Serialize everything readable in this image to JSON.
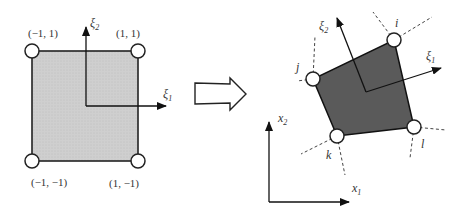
{
  "figure": {
    "parent_element": {
      "fill_color": "#cfcfcf",
      "corner_labels": [
        "(−1, 1)",
        "(1, 1)",
        "(−1, −1)",
        "(1, −1)"
      ],
      "axis_1": {
        "symbol": "ξ",
        "subscript": "1"
      },
      "axis_2": {
        "symbol": "ξ",
        "subscript": "2"
      }
    },
    "mapping_arrow": "hollow-right-arrow",
    "physical_element": {
      "fill_color": "#5a5a5a",
      "node_labels": [
        "i",
        "j",
        "k",
        "l"
      ],
      "local_axis_1": {
        "symbol": "ξ",
        "subscript": "1"
      },
      "local_axis_2": {
        "symbol": "ξ",
        "subscript": "2"
      },
      "global_axis_1": {
        "symbol": "x",
        "subscript": "1"
      },
      "global_axis_2": {
        "symbol": "x",
        "subscript": "2"
      }
    }
  }
}
